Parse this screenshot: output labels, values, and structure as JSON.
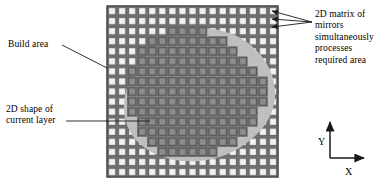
{
  "figure": {
    "background_color": "#ffffff"
  },
  "annotations": [
    {
      "id": "build-area",
      "text": "Build area",
      "position": "left-upper",
      "leader": "diagonal line to grid left edge"
    },
    {
      "id": "2d-shape-of-current-layer",
      "text": "2D shape of\ncurrent layer",
      "position": "left-lower",
      "leader": "horizontal line to grid left edge"
    },
    {
      "id": "2d-matrix-of-mirrors",
      "text": "2D matrix of\nmirrors\nsimultaneously\nprocesses\nrequired area",
      "position": "right-upper",
      "leader": "three arrows pointing into grid cells"
    }
  ],
  "axes": {
    "x_label": "X",
    "y_label": "Y",
    "origin": "lower-left of axis widget"
  },
  "grid": {
    "columns": 17,
    "rows": 17,
    "cell_fill_inactive": "#f2f2f2",
    "cell_fill_active": "#8d8d8d",
    "gap_color": "#6e6e6e",
    "border_color": "#585858",
    "left": 107,
    "top": 6,
    "size": 171
  },
  "shape": {
    "name": "current layer cross-section",
    "fill": "#bfbfbf",
    "outline": "none",
    "description": "irregular rounded blob centred on the grid"
  },
  "colors": {
    "ink": "#000000",
    "shape_gray": "#bfbfbf",
    "active_cell_gray": "#8d8d8d",
    "grid_gray": "#6e6e6e",
    "inactive_cell": "#f2f2f2"
  }
}
